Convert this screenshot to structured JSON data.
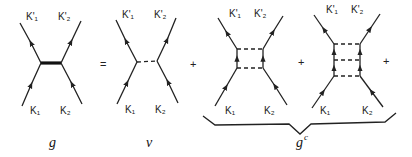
{
  "diagram": {
    "operators": {
      "equals": "=",
      "plus_1": "+",
      "plus_2": "+",
      "plus_3": "+"
    },
    "panels": [
      {
        "id": "g",
        "caption": "g",
        "labels": {
          "top_left": "K'₁",
          "top_right": "K'₂",
          "bottom_left": "K₁",
          "bottom_right": "K₂"
        },
        "interaction": "thick solid line"
      },
      {
        "id": "v",
        "caption": "v",
        "labels": {
          "top_left": "K'₁",
          "top_right": "K'₂",
          "bottom_left": "K₁",
          "bottom_right": "K₂"
        },
        "interaction": "single dashed line"
      },
      {
        "id": "ladder2",
        "labels": {
          "top_left": "K'₁",
          "top_right": "K'₂",
          "bottom_left": "K₁",
          "bottom_right": "K₂"
        },
        "interaction": "two dashed rungs"
      },
      {
        "id": "ladder3",
        "labels": {
          "top_left": "K'₁",
          "top_right": "K'₂",
          "bottom_left": "K₁",
          "bottom_right": "K₂"
        },
        "interaction": "three dashed rungs"
      }
    ],
    "brace": {
      "caption_base": "g",
      "caption_sup": "c"
    }
  }
}
